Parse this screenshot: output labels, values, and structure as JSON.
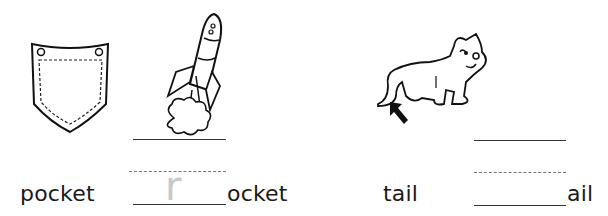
{
  "worksheet": {
    "items": [
      {
        "picture": "pocket",
        "word": "pocket"
      },
      {
        "picture": "rocket",
        "blank_prefix_trace_letter": "r",
        "word_suffix": "ocket"
      },
      {
        "picture": "cat-tail-with-arrow",
        "word": "tail"
      },
      {
        "picture": "blank",
        "word_suffix": "ail"
      }
    ]
  }
}
